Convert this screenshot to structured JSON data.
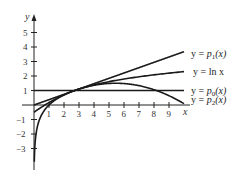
{
  "chart_data": {
    "type": "line",
    "title": "",
    "xlabel": "x",
    "ylabel": "y",
    "xlim": [
      -0.5,
      10
    ],
    "ylim": [
      -4,
      6
    ],
    "grid": false,
    "x_ticks": [
      "1",
      "2",
      "3",
      "4",
      "5",
      "6",
      "7",
      "8",
      "9"
    ],
    "y_ticks": [
      "5",
      "4",
      "3",
      "2",
      "1",
      "−1",
      "−2",
      "−3"
    ],
    "series": [
      {
        "name": "y = p1(x)",
        "label_main": "y = ",
        "label_func": "p",
        "label_sub": "1",
        "label_arg": "(x)",
        "expr": "1 + (x - e)/e",
        "x": [
          0,
          2,
          4,
          6,
          8,
          10
        ],
        "values": [
          0.0,
          0.74,
          1.47,
          2.21,
          2.94,
          3.68
        ]
      },
      {
        "name": "y = ln x",
        "label_main": "y = ",
        "label_func": "ln x",
        "expr": "ln(x)",
        "x": [
          0.02,
          0.5,
          1,
          2,
          3,
          4,
          6,
          8,
          10
        ],
        "values": [
          -3.9,
          -0.69,
          0.0,
          0.69,
          1.1,
          1.39,
          1.79,
          2.08,
          2.3
        ]
      },
      {
        "name": "y = p0(x)",
        "label_main": "y = ",
        "label_func": "p",
        "label_sub": "0",
        "label_arg": "(x)",
        "expr": "1",
        "x": [
          0,
          10
        ],
        "values": [
          1,
          1
        ]
      },
      {
        "name": "y = p2(x)",
        "label_main": "y = ",
        "label_func": "p",
        "label_sub": "2",
        "label_arg": "(x)",
        "expr": "1 + (x - e)/e - (x - e)^2/(2e^2)",
        "x": [
          0,
          2,
          2.718,
          4,
          6,
          8,
          10
        ],
        "values": [
          -0.5,
          0.72,
          1.0,
          1.36,
          1.48,
          0.88,
          0.09
        ]
      }
    ],
    "legend_position": "right, labels at curve ends"
  }
}
